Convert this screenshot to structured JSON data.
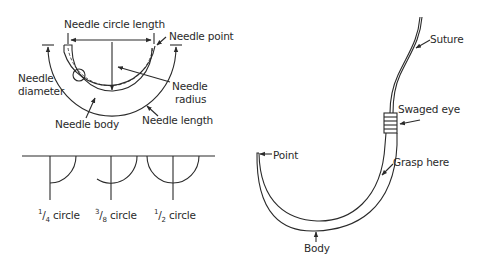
{
  "figure": {
    "needle_anatomy": {
      "labels": {
        "circle_length": "Needle circle length",
        "point": "Needle point",
        "diameter_line1": "Needle",
        "diameter_line2": "diameter",
        "radius_line1": "Needle",
        "radius_line2": "radius",
        "body": "Needle body",
        "length": "Needle length"
      }
    },
    "circle_types": {
      "items": [
        {
          "num": "1",
          "den": "4",
          "suffix": " circle"
        },
        {
          "num": "3",
          "den": "8",
          "suffix": " circle"
        },
        {
          "num": "1",
          "den": "2",
          "suffix": " circle"
        }
      ]
    },
    "swaged_needle": {
      "labels": {
        "suture": "Suture",
        "swaged_eye": "Swaged eye",
        "grasp": "Grasp here",
        "point": "Point",
        "body": "Body"
      }
    }
  },
  "colors": {
    "line": "#2a2a2a",
    "background": "#ffffff"
  }
}
